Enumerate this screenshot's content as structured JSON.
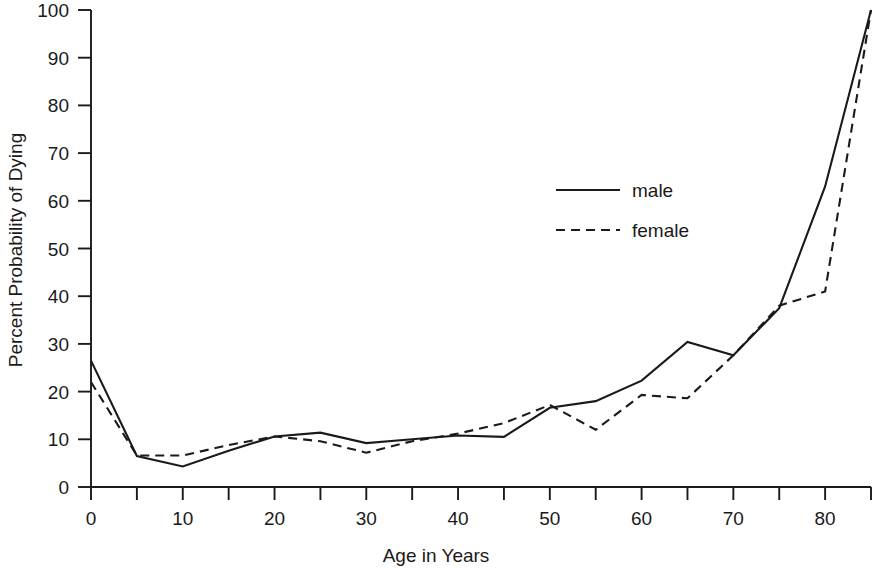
{
  "chart_data": {
    "type": "line",
    "title": "",
    "xlabel": "Age in Years",
    "ylabel": "Percent Probability of Dying",
    "xlim": [
      0,
      85
    ],
    "ylim": [
      0,
      100
    ],
    "xticks": [
      0,
      5,
      10,
      15,
      20,
      25,
      30,
      35,
      40,
      45,
      50,
      55,
      60,
      65,
      70,
      75,
      80,
      85
    ],
    "xtick_labels": [
      "0",
      "",
      "10",
      "",
      "20",
      "",
      "30",
      "",
      "40",
      "",
      "50",
      "",
      "60",
      "",
      "70",
      "",
      "80",
      ""
    ],
    "yticks": [
      0,
      10,
      20,
      30,
      40,
      50,
      60,
      70,
      80,
      90,
      100
    ],
    "ytick_labels": [
      "0",
      "10",
      "20",
      "30",
      "40",
      "50",
      "60",
      "70",
      "80",
      "90",
      "100"
    ],
    "grid": false,
    "legend_position": "center-right",
    "x": [
      0,
      5,
      10,
      15,
      20,
      25,
      30,
      35,
      40,
      45,
      50,
      55,
      60,
      65,
      70,
      75,
      80,
      85
    ],
    "series": [
      {
        "name": "male",
        "style": "solid",
        "color": "#1a1a1a",
        "values": [
          26.5,
          6.5,
          4.3,
          7.6,
          10.6,
          11.4,
          9.2,
          10.0,
          10.8,
          10.5,
          16.6,
          18.0,
          22.3,
          30.4,
          27.6,
          37.5,
          63.0,
          100.0
        ]
      },
      {
        "name": "female",
        "style": "dashed",
        "color": "#1a1a1a",
        "values": [
          22.0,
          6.6,
          6.6,
          8.8,
          10.6,
          9.6,
          7.2,
          9.6,
          11.2,
          13.4,
          17.2,
          12.0,
          19.3,
          18.6,
          27.6,
          38.0,
          41.0,
          100.0
        ]
      }
    ]
  },
  "axis": {
    "x_title": "Age in Years",
    "y_title": "Percent Probability of Dying"
  },
  "legend": {
    "entries": [
      {
        "label": "male",
        "style": "solid"
      },
      {
        "label": "female",
        "style": "dashed"
      }
    ]
  }
}
